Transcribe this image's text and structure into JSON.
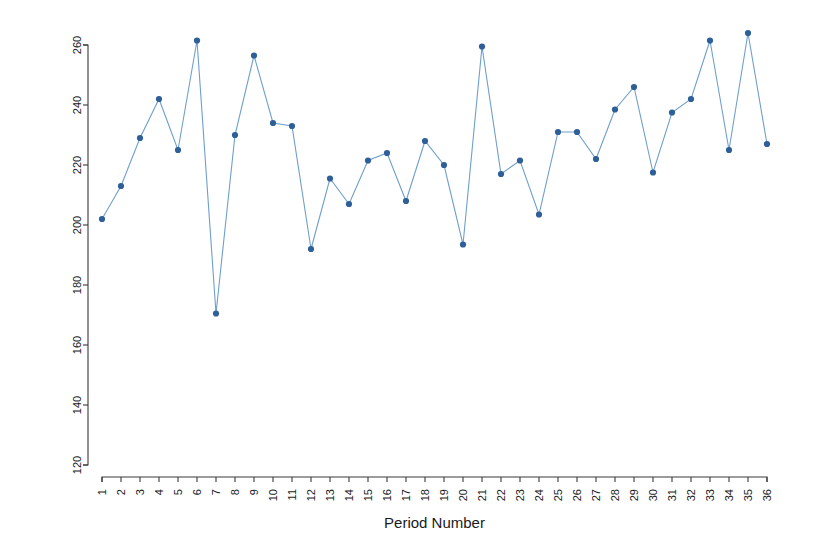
{
  "chart_data": {
    "type": "line",
    "title": "",
    "xlabel": "Period Number",
    "ylabel": "",
    "xlim": [
      1,
      36
    ],
    "ylim": [
      120,
      260
    ],
    "grid": false,
    "legend": null,
    "marker": "filled-circle",
    "series_color": "#2e5f98",
    "line_color": "#6f9fcb",
    "x_tick_rotation_deg": -90,
    "y_tick_rotation_deg": -90,
    "yticks": [
      120,
      140,
      160,
      180,
      200,
      220,
      240,
      260
    ],
    "ytick_labels": [
      "120",
      "140",
      "160",
      "180",
      "200",
      "220",
      "240",
      "260"
    ],
    "categories": [
      1,
      2,
      3,
      4,
      5,
      6,
      7,
      8,
      9,
      10,
      11,
      12,
      13,
      14,
      15,
      16,
      17,
      18,
      19,
      20,
      21,
      22,
      23,
      24,
      25,
      26,
      27,
      28,
      29,
      30,
      31,
      32,
      33,
      34,
      35,
      36
    ],
    "xtick_labels": [
      "1",
      "2",
      "3",
      "4",
      "5",
      "6",
      "7",
      "8",
      "9",
      "10",
      "11",
      "12",
      "13",
      "14",
      "15",
      "16",
      "17",
      "18",
      "19",
      "20",
      "21",
      "22",
      "23",
      "24",
      "25",
      "26",
      "27",
      "28",
      "29",
      "30",
      "31",
      "32",
      "33",
      "34",
      "35",
      "36"
    ],
    "values": [
      202,
      213,
      229,
      242,
      225,
      261.5,
      170.5,
      230,
      256.5,
      234,
      233,
      192,
      215.5,
      207,
      221.5,
      224,
      208,
      228,
      220,
      193.5,
      259.5,
      217,
      221.5,
      203.5,
      231,
      231,
      222,
      238.5,
      246,
      217.5,
      237.5,
      242,
      261.5,
      225,
      264,
      227
    ]
  }
}
